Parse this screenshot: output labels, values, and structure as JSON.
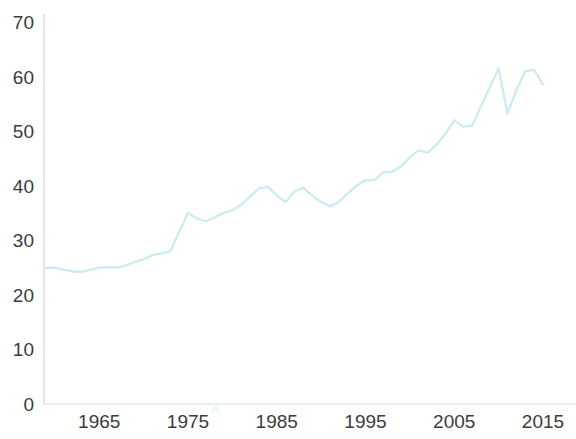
{
  "chart_data": {
    "type": "line",
    "title": "",
    "subtitle": "",
    "xlabel": "",
    "ylabel": "",
    "xlim": [
      1959,
      2015
    ],
    "ylim": [
      0,
      70
    ],
    "grid": false,
    "legend": null,
    "line_color": "#c8ecf0",
    "line_width": 2.2,
    "axis_color": "#cfcfcf",
    "tick_label_color": "#3c3c3c",
    "background_color": "#ffffff",
    "x_ticks": [
      1965,
      1975,
      1985,
      1995,
      2005,
      2015
    ],
    "x_tick_labels": [
      "1965",
      "1975",
      "1985",
      "1995",
      "2005",
      "2015"
    ],
    "y_ticks": [
      0,
      10,
      20,
      30,
      40,
      50,
      60,
      70
    ],
    "y_tick_labels": [
      "0",
      "10",
      "20",
      "30",
      "40",
      "50",
      "60",
      "70"
    ],
    "series": [
      {
        "name": "value",
        "color": "#c8ecf0",
        "x": [
          1959,
          1960,
          1961,
          1962,
          1963,
          1964,
          1965,
          1966,
          1967,
          1968,
          1969,
          1970,
          1971,
          1972,
          1973,
          1974,
          1975,
          1976,
          1977,
          1978,
          1979,
          1980,
          1981,
          1982,
          1983,
          1984,
          1985,
          1986,
          1987,
          1988,
          1989,
          1990,
          1991,
          1992,
          1993,
          1994,
          1995,
          1996,
          1997,
          1998,
          1999,
          2000,
          2001,
          2002,
          2003,
          2004,
          2005,
          2006,
          2007,
          2008,
          2009,
          2010,
          2011,
          2012,
          2013,
          2014,
          2015
        ],
        "values": [
          24.9,
          25.0,
          24.6,
          24.3,
          24.2,
          24.6,
          25.0,
          25.1,
          25.0,
          25.4,
          26.0,
          26.5,
          27.3,
          27.6,
          28.0,
          31.5,
          35.0,
          34.0,
          33.5,
          34.2,
          35.0,
          35.5,
          36.5,
          38.0,
          39.5,
          39.8,
          38.2,
          37.0,
          39.0,
          39.6,
          38.2,
          37.0,
          36.2,
          37.0,
          38.6,
          40.0,
          41.0,
          41.0,
          42.5,
          42.6,
          43.5,
          45.2,
          46.5,
          46.0,
          47.5,
          49.5,
          52.0,
          50.8,
          51.0,
          54.5,
          58.0,
          61.5,
          53.2,
          57.5,
          61.0,
          61.2,
          58.6
        ]
      }
    ],
    "annotation": "A"
  }
}
